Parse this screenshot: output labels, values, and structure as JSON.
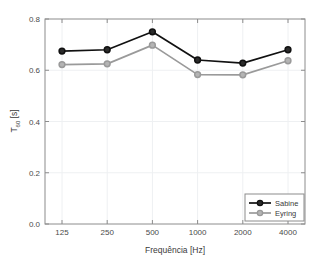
{
  "chart_data": {
    "type": "line",
    "title": "",
    "xlabel": "Frequência [Hz]",
    "ylabel": "T60 [s]",
    "ylabel_base": "T",
    "ylabel_sub": "60",
    "ylabel_unit": " [s]",
    "categories": [
      "125",
      "250",
      "500",
      "1000",
      "2000",
      "4000"
    ],
    "x_tick_labels": [
      "125",
      "250",
      "500",
      "1000",
      "2000",
      "4000"
    ],
    "y_tick_labels": [
      "0.0",
      "0.2",
      "0.4",
      "0.6",
      "0.8"
    ],
    "y_tick_values": [
      0.0,
      0.2,
      0.4,
      0.6,
      0.8
    ],
    "ylim": [
      0.0,
      0.8
    ],
    "grid": true,
    "legend_position": "lower right",
    "series": [
      {
        "name": "Sabine",
        "color": "#111111",
        "marker": "o",
        "values": [
          0.675,
          0.68,
          0.75,
          0.64,
          0.628,
          0.68
        ]
      },
      {
        "name": "Eyring",
        "color": "#9a9a9a",
        "marker": "o",
        "values": [
          0.622,
          0.625,
          0.698,
          0.583,
          0.582,
          0.637
        ]
      }
    ]
  },
  "legend": {
    "entries": [
      {
        "label": "Sabine"
      },
      {
        "label": "Eyring"
      }
    ]
  },
  "colors": {
    "sabine": "#111111",
    "eyring": "#9a9a9a",
    "axis": "#8c8c8c",
    "grid": "#eef0f2",
    "background": "#ffffff"
  }
}
